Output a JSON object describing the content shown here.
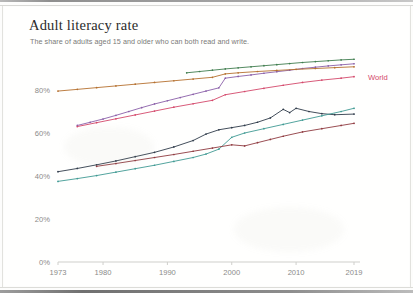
{
  "header": {
    "title": "Adult literacy rate",
    "subtitle": "The share of adults aged 15 and older who can both read and write."
  },
  "labels": {
    "world": "World"
  },
  "colors": {
    "world": "#d4486b",
    "green": "#3f7d4e",
    "purple": "#8a5fa8",
    "orange": "#b5702f",
    "navy": "#2f3b4a",
    "teal": "#3f9a93",
    "maroon": "#8f3a3f",
    "axis": "#cfcfcb",
    "tick_text": "#8b8b89",
    "title_text": "#2b2b2b",
    "subtitle_text": "#7a7a78",
    "background": "#fffffe"
  },
  "chart_data": {
    "type": "line",
    "title": "Adult literacy rate",
    "subtitle": "The share of adults aged 15 and older who can both read and write.",
    "xlabel": "",
    "ylabel": "",
    "xlim": [
      1973,
      2019
    ],
    "ylim": [
      0,
      100
    ],
    "grid": false,
    "legend": "direct-label-right",
    "ytick_labels": [
      "0%",
      "20%",
      "40%",
      "60%",
      "80%"
    ],
    "ytick_values": [
      0,
      20,
      40,
      60,
      80
    ],
    "xtick_labels": [
      "1973",
      "1980",
      "1990",
      "2000",
      "2010",
      "2019"
    ],
    "xtick_values": [
      1973,
      1980,
      1990,
      2000,
      2010,
      2019
    ],
    "markers": true,
    "series": [
      {
        "name": "series-green",
        "color": "#3f7d4e",
        "label": "",
        "x": [
          1993,
          1995,
          1997,
          1999,
          2001,
          2003,
          2005,
          2007,
          2009,
          2011,
          2013,
          2015,
          2017,
          2019
        ],
        "values": [
          88.0,
          88.6,
          89.2,
          89.8,
          90.3,
          90.8,
          91.3,
          91.8,
          92.3,
          92.8,
          93.2,
          93.6,
          94.0,
          94.3
        ]
      },
      {
        "name": "series-purple",
        "color": "#8a5fa8",
        "label": "",
        "x": [
          1976,
          1978,
          1980,
          1982,
          1984,
          1986,
          1988,
          1990,
          1992,
          1994,
          1996,
          1998,
          1999,
          2001,
          2003,
          2005,
          2007,
          2009,
          2011,
          2013,
          2015,
          2017,
          2019
        ],
        "values": [
          63.5,
          65.0,
          66.5,
          68.2,
          70.0,
          71.8,
          73.5,
          75.0,
          76.5,
          78.0,
          79.5,
          81.0,
          85.5,
          86.3,
          87.0,
          87.8,
          88.5,
          89.2,
          90.0,
          90.6,
          91.2,
          91.7,
          92.2
        ]
      },
      {
        "name": "series-orange",
        "color": "#b5702f",
        "label": "",
        "x": [
          1973,
          1976,
          1979,
          1982,
          1985,
          1988,
          1991,
          1994,
          1997,
          1999,
          2001,
          2004,
          2007,
          2010,
          2013,
          2016,
          2019
        ],
        "values": [
          79.5,
          80.3,
          81.1,
          81.9,
          82.7,
          83.5,
          84.3,
          85.1,
          85.9,
          87.5,
          88.0,
          88.6,
          89.1,
          89.6,
          90.0,
          90.4,
          90.8
        ]
      },
      {
        "name": "series-world",
        "color": "#d4486b",
        "label": "World",
        "x": [
          1976,
          1979,
          1982,
          1985,
          1988,
          1991,
          1994,
          1997,
          1999,
          2002,
          2005,
          2008,
          2011,
          2014,
          2017,
          2019
        ],
        "values": [
          63.0,
          64.8,
          66.6,
          68.4,
          70.2,
          72.0,
          73.6,
          75.2,
          77.8,
          79.3,
          80.8,
          82.2,
          83.5,
          84.6,
          85.5,
          86.2
        ]
      },
      {
        "name": "series-navy",
        "color": "#2f3b4a",
        "label": "",
        "x": [
          1973,
          1976,
          1979,
          1982,
          1985,
          1988,
          1991,
          1994,
          1996,
          1998,
          2000,
          2002,
          2004,
          2006,
          2008,
          2009,
          2010,
          2012,
          2014,
          2016,
          2019
        ],
        "values": [
          42.0,
          43.5,
          45.2,
          47.0,
          49.0,
          51.0,
          53.5,
          56.5,
          59.5,
          61.5,
          62.5,
          63.5,
          65.0,
          67.0,
          71.0,
          69.5,
          71.5,
          70.0,
          69.0,
          68.5,
          68.8
        ]
      },
      {
        "name": "series-teal",
        "color": "#3f9a93",
        "label": "",
        "x": [
          1973,
          1976,
          1979,
          1982,
          1985,
          1988,
          1991,
          1994,
          1996,
          1998,
          2000,
          2002,
          2005,
          2008,
          2011,
          2014,
          2017,
          2019
        ],
        "values": [
          37.5,
          38.8,
          40.2,
          41.8,
          43.4,
          45.0,
          46.8,
          48.6,
          50.2,
          52.5,
          58.0,
          60.0,
          62.0,
          64.0,
          66.0,
          68.0,
          70.0,
          71.5
        ]
      },
      {
        "name": "series-maroon",
        "color": "#8f3a3f",
        "label": "",
        "x": [
          1979,
          1982,
          1985,
          1988,
          1991,
          1994,
          1997,
          2000,
          2002,
          2004,
          2006,
          2008,
          2011,
          2014,
          2017,
          2019
        ],
        "values": [
          44.5,
          45.8,
          47.2,
          48.6,
          50.0,
          51.5,
          53.0,
          54.5,
          54.0,
          55.5,
          57.0,
          58.5,
          60.5,
          62.0,
          63.5,
          64.5
        ]
      }
    ]
  }
}
